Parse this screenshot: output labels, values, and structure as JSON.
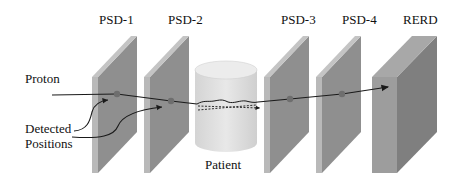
{
  "diagram": {
    "type": "proton-ct-setup",
    "detectors": [
      {
        "id": "psd1",
        "label": "PSD-1"
      },
      {
        "id": "psd2",
        "label": "PSD-2"
      },
      {
        "id": "psd3",
        "label": "PSD-3"
      },
      {
        "id": "psd4",
        "label": "PSD-4"
      },
      {
        "id": "rerd",
        "label": "RERD"
      }
    ],
    "patient": {
      "label": "Patient"
    },
    "annotations": {
      "proton": "Proton",
      "detected_line1": "Detected",
      "detected_line2": "Positions"
    },
    "colors": {
      "plate_front": "#b9b9b9",
      "plate_side": "#8f8f8f",
      "plate_top": "#c4c4c4",
      "rerd_front": "#9d9d9d",
      "rerd_side": "#7f7f7f",
      "rerd_top": "#a8a8a8",
      "patient_fill": "#e2e2e2",
      "track": "#1a1a1a",
      "hit_dot": "#6e6e6e"
    }
  }
}
